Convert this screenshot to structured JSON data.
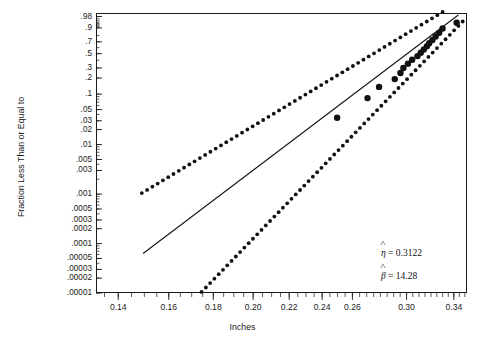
{
  "chart_data": {
    "type": "scatter",
    "title": "",
    "xlabel": "Inches",
    "ylabel": "Fraction Less Than or Equal to",
    "plot_kind": "weibull-probability-plot",
    "grid": false,
    "legend": null,
    "xlim": [
      0.132,
      0.352
    ],
    "x_tick_labels": [
      "0.14",
      "0.16",
      "0.18",
      "0.20",
      "0.22",
      "0.24",
      "0.26",
      "0.30",
      "0.34"
    ],
    "x_tick_values": [
      0.14,
      0.16,
      0.18,
      0.2,
      0.22,
      0.24,
      0.26,
      0.3,
      0.34
    ],
    "y_tick_labels": [
      ".98",
      ".9",
      ".7",
      ".5",
      ".3",
      ".2",
      ".1",
      ".05",
      ".03",
      ".02",
      ".01",
      ".005",
      ".003",
      ".001",
      ".0005",
      ".0003",
      ".0002",
      ".0001",
      ".00005",
      ".00003",
      ".00002",
      ".00001"
    ],
    "y_tick_values": [
      0.98,
      0.9,
      0.7,
      0.5,
      0.3,
      0.2,
      0.1,
      0.05,
      0.03,
      0.02,
      0.01,
      0.005,
      0.003,
      0.001,
      0.0005,
      0.0003,
      0.0002,
      0.0001,
      5e-05,
      3e-05,
      2e-05,
      1e-05
    ],
    "ylim": [
      1e-05,
      0.99
    ],
    "series": [
      {
        "name": "data-points",
        "marker": "filled-circle",
        "points": [
          {
            "x": 0.2497,
            "y": 0.0345
          },
          {
            "x": 0.2706,
            "y": 0.0838
          },
          {
            "x": 0.279,
            "y": 0.137
          },
          {
            "x": 0.2908,
            "y": 0.191
          },
          {
            "x": 0.2952,
            "y": 0.245
          },
          {
            "x": 0.2975,
            "y": 0.299
          },
          {
            "x": 0.3011,
            "y": 0.353
          },
          {
            "x": 0.3045,
            "y": 0.407
          },
          {
            "x": 0.3088,
            "y": 0.461
          },
          {
            "x": 0.3115,
            "y": 0.515
          },
          {
            "x": 0.314,
            "y": 0.569
          },
          {
            "x": 0.3166,
            "y": 0.623
          },
          {
            "x": 0.3185,
            "y": 0.677
          },
          {
            "x": 0.3212,
            "y": 0.731
          },
          {
            "x": 0.324,
            "y": 0.785
          },
          {
            "x": 0.327,
            "y": 0.839
          },
          {
            "x": 0.33,
            "y": 0.893
          },
          {
            "x": 0.3425,
            "y": 0.946
          }
        ]
      },
      {
        "name": "fitted-line",
        "style": "solid",
        "endpoints": [
          {
            "x": 0.1495,
            "y": 6.3e-05
          },
          {
            "x": 0.344,
            "y": 0.985
          }
        ]
      },
      {
        "name": "upper-confidence-bound",
        "style": "dotted",
        "endpoints": [
          {
            "x": 0.149,
            "y": 0.00105
          },
          {
            "x": 0.33,
            "y": 0.992
          }
        ]
      },
      {
        "name": "lower-confidence-bound",
        "style": "dotted",
        "endpoints": [
          {
            "x": 0.1745,
            "y": 1.05e-05
          },
          {
            "x": 0.348,
            "y": 0.955
          }
        ]
      }
    ],
    "annotations": [
      {
        "name": "eta-estimate",
        "symbol": "η",
        "hat": true,
        "equals": "=",
        "value": "0.3122",
        "text": "η̂ = 0.3122"
      },
      {
        "name": "beta-estimate",
        "symbol": "β",
        "hat": true,
        "equals": "=",
        "value": "14.28",
        "text": "β̂ = 14.28"
      }
    ]
  },
  "axes": {
    "x_title": "Inches",
    "y_title": "Fraction Less Than or Equal to"
  }
}
